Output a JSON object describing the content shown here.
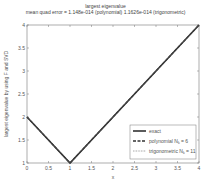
{
  "chart_data": {
    "type": "line",
    "title": "largest eigenvalue",
    "subtitle": "mean quad error = 1.148e-014 (polynomial) 1.1626e-014 (trigonometric)",
    "xlabel": "x",
    "ylabel": "largest eigenvalue by using F and SVD",
    "xlim": [
      0,
      4
    ],
    "ylim": [
      1,
      4
    ],
    "xticks": [
      "0",
      "0.5",
      "1",
      "1.5",
      "2",
      "2.5",
      "3",
      "3.5",
      "4"
    ],
    "yticks": [
      "1",
      "1.5",
      "2",
      "2.5",
      "3",
      "3.5",
      "4"
    ],
    "grid": false,
    "legend_position": "lower right",
    "series": [
      {
        "name": "exact",
        "style": "solid",
        "x": [
          0,
          1,
          4
        ],
        "y": [
          2,
          1,
          4
        ]
      },
      {
        "name": "polynomial N_k = 6",
        "style": "dashed",
        "x": [
          0,
          1,
          4
        ],
        "y": [
          2,
          1,
          4
        ]
      },
      {
        "name": "trigonometric N_k = 11",
        "style": "dotted",
        "x": [
          0,
          1,
          4
        ],
        "y": [
          2,
          1,
          4
        ]
      }
    ]
  },
  "legend": {
    "items": [
      {
        "label": "exact"
      },
      {
        "label": "polynomial N",
        "sub": "k",
        "suffix": " = 6"
      },
      {
        "label": "trigonometric N",
        "sub": "k",
        "suffix": " = 11"
      }
    ]
  }
}
